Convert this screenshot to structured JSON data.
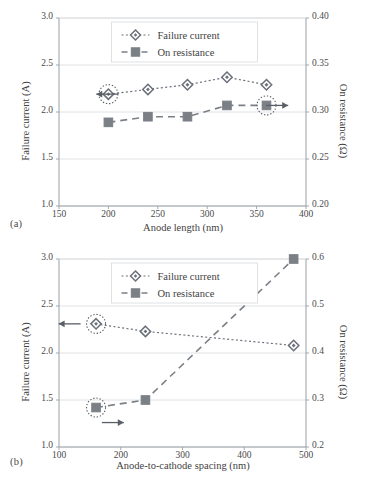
{
  "figure": {
    "background": "#ffffff",
    "series_colors": {
      "failure_current": "#6b6f78",
      "on_resistance": "#7b7f86",
      "axis": "#9aa0a6",
      "grid": "#d8dadd",
      "text": "#3f3f3f",
      "annotation": "#5a5e66"
    }
  },
  "panels": [
    {
      "id": "a",
      "label": "(a)",
      "legend": {
        "position": "top-center",
        "entries": [
          {
            "label": "Failure current",
            "marker": "diamond-open",
            "dash": "dotted"
          },
          {
            "label": "On resistance",
            "marker": "square-filled",
            "dash": "dashed"
          }
        ]
      },
      "arrows": [
        {
          "name": "left-axis-arrow",
          "direction": "left",
          "x": 210,
          "y": 2.19
        },
        {
          "name": "right-axis-arrow",
          "direction": "right",
          "x": 382,
          "y": 2.06
        }
      ],
      "highlights": [
        {
          "name": "highlight-failure-current-200",
          "series": "Failure current",
          "x": 200,
          "y": 2.19
        },
        {
          "name": "highlight-on-resistance-360",
          "series": "On resistance",
          "x": 360,
          "y": 0.307
        }
      ],
      "chart_data": {
        "type": "line",
        "title": "",
        "xlabel": "Anode length (nm)",
        "ylabel": "Failure current (A)",
        "y2label": "On resistance (Ω)",
        "xlim": [
          150,
          400
        ],
        "xticks": [
          150,
          200,
          250,
          300,
          350,
          400
        ],
        "ylim": [
          1.0,
          3.0
        ],
        "yticks": [
          1.0,
          1.5,
          2.0,
          2.5,
          3.0
        ],
        "ytick_labels": [
          "1.0",
          "1.5",
          "2.0",
          "2.5",
          "3.0"
        ],
        "y2lim": [
          0.2,
          0.4
        ],
        "y2ticks": [
          0.2,
          0.25,
          0.3,
          0.35,
          0.4
        ],
        "y2tick_labels": [
          "0.20",
          "0.25",
          "0.30",
          "0.35",
          "0.40"
        ],
        "grid": true,
        "legend": "top-center",
        "x": [
          200,
          240,
          280,
          320,
          360
        ],
        "series": [
          {
            "name": "Failure current",
            "axis": "left",
            "unit": "A",
            "values": [
              2.19,
              2.24,
              2.29,
              2.37,
              2.29
            ]
          },
          {
            "name": "On resistance",
            "axis": "right",
            "unit": "Ω",
            "values": [
              0.289,
              0.295,
              0.295,
              0.307,
              0.307
            ]
          }
        ]
      }
    },
    {
      "id": "b",
      "label": "(b)",
      "legend": {
        "position": "top-center",
        "entries": [
          {
            "label": "Failure current",
            "marker": "diamond-open",
            "dash": "dotted"
          },
          {
            "label": "On resistance",
            "marker": "square-filled",
            "dash": "dashed"
          }
        ]
      },
      "arrows": [
        {
          "name": "left-axis-arrow",
          "direction": "left",
          "x": 135,
          "y": 2.31
        },
        {
          "name": "right-axis-arrow",
          "direction": "right",
          "x": 205,
          "y": 1.26
        }
      ],
      "highlights": [
        {
          "name": "highlight-failure-current-160",
          "series": "Failure current",
          "x": 160,
          "y": 2.31
        },
        {
          "name": "highlight-on-resistance-160",
          "series": "On resistance",
          "x": 160,
          "y": 0.284
        }
      ],
      "chart_data": {
        "type": "line",
        "title": "",
        "xlabel": "Anode-to-cathode spacing (nm)",
        "ylabel": "Failure current (A)",
        "y2label": "On resistance (Ω)",
        "xlim": [
          100,
          500
        ],
        "xticks": [
          100,
          200,
          300,
          400,
          500
        ],
        "ylim": [
          1.0,
          3.0
        ],
        "yticks": [
          1.0,
          1.5,
          2.0,
          2.5,
          3.0
        ],
        "ytick_labels": [
          "1.0",
          "1.5",
          "2.0",
          "2.5",
          "3.0"
        ],
        "y2lim": [
          0.2,
          0.6
        ],
        "y2ticks": [
          0.2,
          0.3,
          0.4,
          0.5,
          0.6
        ],
        "y2tick_labels": [
          "0.2",
          "0.3",
          "0.4",
          "0.5",
          "0.6"
        ],
        "grid": true,
        "legend": "top-center",
        "x": [
          160,
          240,
          480
        ],
        "series": [
          {
            "name": "Failure current",
            "axis": "left",
            "unit": "A",
            "values": [
              2.31,
              2.23,
              2.08
            ]
          },
          {
            "name": "On resistance",
            "axis": "right",
            "unit": "Ω",
            "values": [
              0.284,
              0.3,
              0.6
            ]
          }
        ]
      }
    }
  ]
}
